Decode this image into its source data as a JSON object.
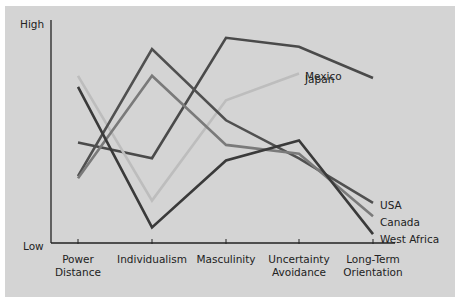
{
  "chart_data": {
    "type": "line",
    "title": "",
    "xlabel": "",
    "ylabel": "",
    "y_axis_labels": {
      "top": "High",
      "bottom": "Low"
    },
    "ylim": [
      0,
      100
    ],
    "categories": [
      "Power Distance",
      "Individualism",
      "Masculinity",
      "Uncertainty Avoidance",
      "Long-Term Orientation"
    ],
    "category_lines": [
      [
        "Power",
        "Distance"
      ],
      [
        "Individualism"
      ],
      [
        "Masculinity"
      ],
      [
        "Uncertainty",
        "Avoidance"
      ],
      [
        "Long-Term",
        "Orientation"
      ]
    ],
    "grid": false,
    "legend": "inline end labels",
    "series": [
      {
        "name": "Japan",
        "color": "#4a4a4a",
        "values": [
          45,
          38,
          92,
          88,
          74
        ],
        "label_pos": [
          305,
          83
        ]
      },
      {
        "name": "Mexico",
        "color": "#bdbdbd",
        "values": [
          75,
          19,
          64,
          76,
          null
        ],
        "label_pos": [
          305,
          80
        ]
      },
      {
        "name": "USA",
        "color": "#505050",
        "values": [
          30,
          87,
          55,
          38,
          18
        ],
        "label_pos": [
          380,
          209
        ]
      },
      {
        "name": "Canada",
        "color": "#7a7a7a",
        "values": [
          29,
          75,
          44,
          40,
          12
        ],
        "label_pos": [
          380,
          226
        ]
      },
      {
        "name": "West Africa",
        "color": "#3a3a3a",
        "values": [
          70,
          7,
          37,
          46,
          4
        ],
        "label_pos": [
          380,
          243
        ]
      }
    ]
  }
}
